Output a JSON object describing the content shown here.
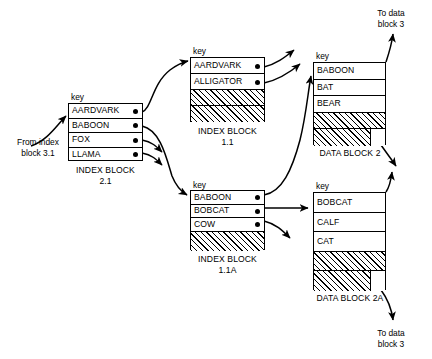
{
  "diagram": {
    "notes": [
      {
        "id": "from-index",
        "text_line1": "From index",
        "text_line2": "block 3.1"
      },
      {
        "id": "to-data-top",
        "text_line1": "To data",
        "text_line2": "block 3"
      },
      {
        "id": "to-data-bottom",
        "text_line1": "To data",
        "text_line2": "block 3"
      }
    ],
    "key_label": "key",
    "blocks": [
      {
        "id": "index-block-2-1",
        "caption_line1": "INDEX BLOCK",
        "caption_line2": "2.1",
        "key_label": "key",
        "rows": [
          {
            "label": "AARDVARK",
            "hatched": false,
            "pointer": true
          },
          {
            "label": "BABOON",
            "hatched": false,
            "pointer": true
          },
          {
            "label": "FOX",
            "hatched": false,
            "pointer": true
          },
          {
            "label": "LLAMA",
            "hatched": false,
            "pointer": true
          }
        ]
      },
      {
        "id": "index-block-1-1",
        "caption_line1": "INDEX BLOCK",
        "caption_line2": "1.1",
        "key_label": "key",
        "rows": [
          {
            "label": "AARDVARK",
            "hatched": false,
            "pointer": true
          },
          {
            "label": "ALLIGATOR",
            "hatched": false,
            "pointer": true
          },
          {
            "label": "",
            "hatched": true,
            "pointer": false
          },
          {
            "label": "",
            "hatched": true,
            "pointer": false
          }
        ]
      },
      {
        "id": "index-block-1-1a",
        "caption_line1": "INDEX BLOCK",
        "caption_line2": "1.1A",
        "key_label": "key",
        "rows": [
          {
            "label": "BABOON",
            "hatched": false,
            "pointer": true
          },
          {
            "label": "BOBCAT",
            "hatched": false,
            "pointer": true
          },
          {
            "label": "COW",
            "hatched": false,
            "pointer": true
          },
          {
            "label": "",
            "hatched": true,
            "pointer": false
          }
        ]
      },
      {
        "id": "data-block-2",
        "caption_line1": "DATA BLOCK 2",
        "caption_line2": "",
        "key_label": "key",
        "rows": [
          {
            "label": "BABOON",
            "hatched": false,
            "pointer": false
          },
          {
            "label": "BAT",
            "hatched": false,
            "pointer": false
          },
          {
            "label": "BEAR",
            "hatched": false,
            "pointer": false
          },
          {
            "label": "",
            "hatched": true,
            "pointer": false
          },
          {
            "label": "",
            "hatched": true,
            "pointer": false,
            "partial": true
          }
        ]
      },
      {
        "id": "data-block-2a",
        "caption_line1": "DATA BLOCK 2A",
        "caption_line2": "",
        "key_label": "key",
        "rows": [
          {
            "label": "BOBCAT",
            "hatched": false,
            "pointer": false
          },
          {
            "label": "CALF",
            "hatched": false,
            "pointer": false
          },
          {
            "label": "CAT",
            "hatched": false,
            "pointer": false
          },
          {
            "label": "",
            "hatched": true,
            "pointer": false
          },
          {
            "label": "",
            "hatched": true,
            "pointer": false,
            "partial": true
          }
        ]
      }
    ]
  }
}
